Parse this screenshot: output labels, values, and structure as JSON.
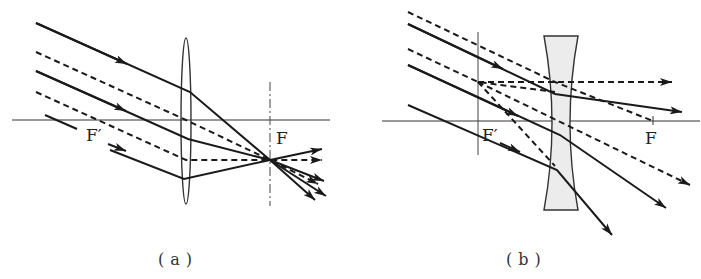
{
  "diagram": {
    "panels": [
      {
        "id": "a",
        "caption": "(a)",
        "lens_type": "convex",
        "labels": {
          "focus_image": "F",
          "focus_object": "F′"
        }
      },
      {
        "id": "b",
        "caption": "(b)",
        "lens_type": "concave",
        "labels": {
          "focus_image": "F",
          "focus_object": "F′"
        }
      }
    ],
    "colors": {
      "stroke": "#1a1a1a",
      "lens_fill": "#ececec",
      "axis": "#333333"
    }
  }
}
